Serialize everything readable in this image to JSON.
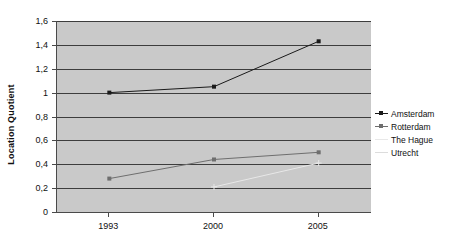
{
  "chart_data": {
    "type": "line",
    "title": "",
    "xlabel": "",
    "ylabel": "Location Quotient",
    "categories": [
      "1993",
      "2000",
      "2005"
    ],
    "ylim": [
      0,
      1.6
    ],
    "yticks": [
      "0",
      "0,2",
      "0,4",
      "0,6",
      "0,8",
      "1",
      "1,2",
      "1,4",
      "1,6"
    ],
    "ytick_values": [
      0,
      0.2,
      0.4,
      0.6,
      0.8,
      1.0,
      1.2,
      1.4,
      1.6
    ],
    "grid": true,
    "legend_position": "right",
    "plot_background": "#c9c9c9",
    "series": [
      {
        "name": "Amsterdam",
        "color": "#1a1a1a",
        "marker": "square",
        "values": [
          1.0,
          1.05,
          1.43
        ]
      },
      {
        "name": "Rotterdam",
        "color": "#6e6e6e",
        "marker": "square",
        "values": [
          0.28,
          0.44,
          0.5
        ]
      },
      {
        "name": "The Hague",
        "color": "#e8e8e8",
        "marker": "cross",
        "values": [
          null,
          0.21,
          0.41
        ]
      },
      {
        "name": "Utrecht",
        "color": "#dcdcdc",
        "marker": "cross",
        "values": [
          null,
          null,
          null
        ]
      }
    ]
  },
  "legend": {
    "items": [
      {
        "label": "Amsterdam"
      },
      {
        "label": "Rotterdam"
      },
      {
        "label": "The Hague"
      },
      {
        "label": "Utrecht"
      }
    ]
  },
  "axes": {
    "y_title": "Location Quotient"
  }
}
